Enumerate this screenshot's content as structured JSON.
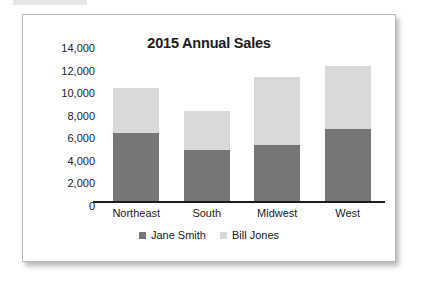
{
  "chart_data": {
    "type": "bar",
    "subtype": "stacked-column",
    "title": "2015 Annual Sales",
    "xlabel": "",
    "ylabel": "",
    "categories": [
      "Northeast",
      "South",
      "Midwest",
      "West"
    ],
    "series": [
      {
        "name": "Jane Smith",
        "color": "#767676",
        "values": [
          6000,
          4500,
          5000,
          6400
        ]
      },
      {
        "name": "Bill Jones",
        "color": "#d9d9d9",
        "values": [
          4000,
          3500,
          6000,
          5600
        ]
      }
    ],
    "totals": [
      10000,
      8000,
      11000,
      12000
    ],
    "ylim": [
      0,
      14000
    ],
    "ytick_step": 2000,
    "ytick_labels": [
      "14,000",
      "12,000",
      "10,000",
      "8,000",
      "6,000",
      "4,000",
      "2,000",
      "0"
    ],
    "ytick_values": [
      14000,
      12000,
      10000,
      8000,
      6000,
      4000,
      2000,
      0
    ],
    "grid": false,
    "legend_position": "bottom",
    "legend": [
      {
        "label": "Jane Smith",
        "color": "#767676"
      },
      {
        "label": "Bill Jones",
        "color": "#d9d9d9"
      }
    ]
  },
  "card": {
    "border_color": "#b8b8b8",
    "background": "#ffffff"
  }
}
